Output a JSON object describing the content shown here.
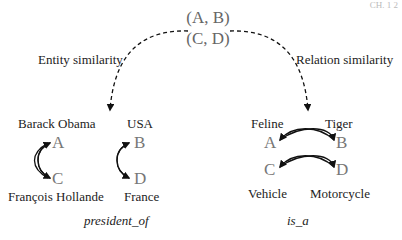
{
  "corner_label": "CH. 1 2",
  "center": {
    "pair1": "(A, B)",
    "pair2": "(C, D)"
  },
  "labels": {
    "left": "Entity similarity",
    "right": "Relation similarity"
  },
  "entity_example": {
    "top_left": "Barack Obama",
    "top_right": "USA",
    "bottom_left": "François Hollande",
    "bottom_right": "France",
    "letters": {
      "a": "A",
      "b": "B",
      "c": "C",
      "d": "D"
    },
    "relation": "president_of"
  },
  "relation_example": {
    "top_left": "Feline",
    "top_right": "Tiger",
    "bottom_left": "Vehicle",
    "bottom_right": "Motorcycle",
    "letters": {
      "a": "A",
      "b": "B",
      "c": "C",
      "d": "D"
    },
    "relation": "is_a"
  }
}
